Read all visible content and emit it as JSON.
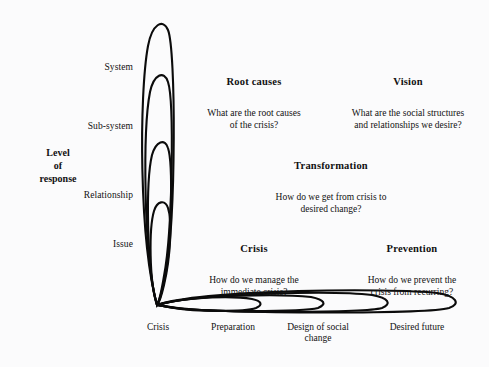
{
  "diagram": {
    "axis_vertical": {
      "title": "Level\nof\nresponse",
      "levels": [
        {
          "label": "System"
        },
        {
          "label": "Sub-system"
        },
        {
          "label": "Relationship"
        },
        {
          "label": "Issue"
        }
      ]
    },
    "axis_horizontal": {
      "phases": [
        {
          "label": "Crisis"
        },
        {
          "label": "Preparation"
        },
        {
          "label": "Design of social\nchange"
        },
        {
          "label": "Desired future"
        }
      ]
    },
    "quadrants": [
      {
        "id": "root-causes",
        "title": "Root causes",
        "body": "What are the root causes\nof the crisis?"
      },
      {
        "id": "vision",
        "title": "Vision",
        "body": "What are the social structures\nand relationships we desire?"
      },
      {
        "id": "transformation",
        "title": "Transformation",
        "body": "How do we get from crisis to\ndesired change?"
      },
      {
        "id": "crisis",
        "title": "Crisis",
        "body": "How do we manage the\nimmediate crisis?"
      },
      {
        "id": "prevention",
        "title": "Prevention",
        "body": "How do we prevent the\ncrisis from recurring?"
      }
    ],
    "colors": {
      "background": "#fbfbfc",
      "ink": "#111111",
      "stroke": "#0b0b0b"
    }
  }
}
